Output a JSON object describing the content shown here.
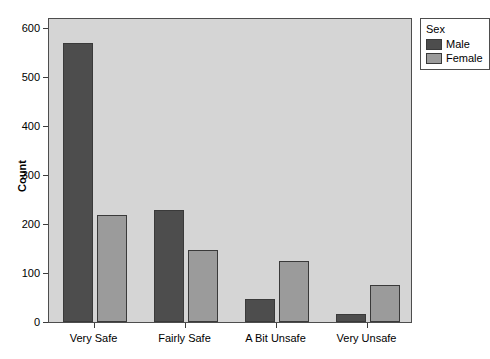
{
  "chart_data": {
    "type": "bar",
    "title": "",
    "xlabel": "",
    "ylabel": "Count",
    "categories": [
      "Very Safe",
      "Fairly Safe",
      "A Bit Unsafe",
      "Very Unsafe"
    ],
    "series": [
      {
        "name": "Male",
        "color": "#4d4d4d",
        "values": [
          570,
          228,
          46,
          16
        ]
      },
      {
        "name": "Female",
        "color": "#9b9b9b",
        "values": [
          218,
          147,
          125,
          75
        ]
      }
    ],
    "ylim": [
      0,
      600
    ],
    "yticks": [
      0,
      100,
      200,
      300,
      400,
      500,
      600
    ],
    "ytick_labels": [
      "0",
      "100",
      "200",
      "300",
      "400",
      "500",
      "600"
    ],
    "grid": false,
    "legend": {
      "title": "Sex",
      "position": "right-top",
      "entries": [
        {
          "label": "Male",
          "color": "#4d4d4d"
        },
        {
          "label": "Female",
          "color": "#9b9b9b"
        }
      ]
    },
    "panel_background": "#d5d5d5",
    "axis_color": "#3c3c3c"
  }
}
